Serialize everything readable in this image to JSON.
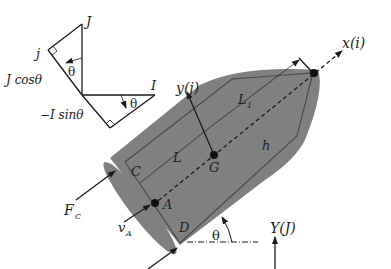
{
  "diagram": {
    "colors": {
      "hull_fill": "#808080",
      "hull_outline": "#4a4a4a",
      "ink": "#1a1a1a",
      "background": "#ffffff"
    },
    "inset_triangle": {
      "labels": {
        "J": "J",
        "j": "j",
        "I": "I",
        "theta_upper": "θ",
        "theta_lower": "θ",
        "j_component": "J cosθ",
        "i_component": "−I sinθ"
      }
    },
    "body": {
      "axis_x": "x(i)",
      "axis_y": "y(j)",
      "L1": "L",
      "L1_sub": "1",
      "L": "L",
      "h": "h",
      "G": "G",
      "C": "C",
      "A": "A",
      "D": "D",
      "theta": "θ",
      "force_label": "F",
      "force_sub": "C",
      "velocity_label": "v",
      "velocity_sub": "A"
    },
    "global_frame": {
      "Y_axis": "Y(J)"
    }
  }
}
